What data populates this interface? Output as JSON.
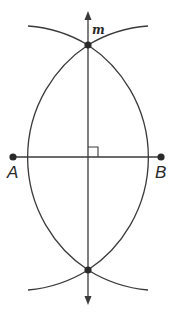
{
  "diagram": {
    "type": "perpendicular-bisector-construction",
    "colors": {
      "stroke": "#3a3a3a",
      "point": "#2a2a2a",
      "background": "#ffffff"
    },
    "points": {
      "A": {
        "label": "A",
        "x": 13,
        "y": 157
      },
      "B": {
        "label": "B",
        "x": 161,
        "y": 157
      },
      "top_intersection": {
        "x": 88,
        "y": 45
      },
      "bottom_intersection": {
        "x": 88,
        "y": 270
      }
    },
    "line_m": {
      "label": "m",
      "x": 88,
      "y_top": 12,
      "y_bottom": 303
    },
    "segment_AB": {
      "from": "A",
      "to": "B"
    },
    "arc_radius": 135,
    "right_angle_marker": true
  }
}
